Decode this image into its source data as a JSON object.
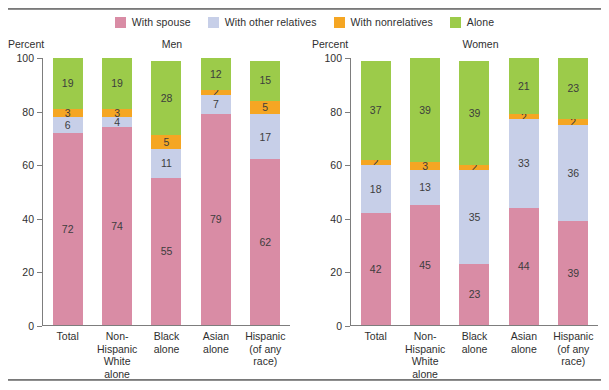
{
  "legend": {
    "items": [
      {
        "label": "With spouse",
        "key": "spouse",
        "color": "#d98ca5"
      },
      {
        "label": "With other relatives",
        "key": "relatives",
        "color": "#c7cfe8"
      },
      {
        "label": "With nonrelatives",
        "key": "nonrelatives",
        "color": "#f5a623"
      },
      {
        "label": "Alone",
        "key": "alone",
        "color": "#9ccb4a"
      }
    ]
  },
  "panels": [
    {
      "axis_name": "Percent",
      "title": "Men"
    },
    {
      "axis_name": "Percent",
      "title": "Women"
    }
  ],
  "chart_data": {
    "type": "bar",
    "title": "",
    "subtitle": "",
    "stacked": true,
    "xlabel": "",
    "ylabel": "Percent",
    "ylim": [
      0,
      100
    ],
    "yticks": [
      0,
      20,
      40,
      60,
      80,
      100
    ],
    "ytick_labels": [
      "0",
      "20",
      "40",
      "60",
      "80",
      "100"
    ],
    "grid": false,
    "legend_position": "top-center",
    "legend_entries": [
      "With spouse",
      "With other relatives",
      "With nonrelatives",
      "Alone"
    ],
    "categories": [
      "Total",
      "Non-Hispanic White alone",
      "Black alone",
      "Asian alone",
      "Hispanic (of any race)"
    ],
    "category_lines": [
      [
        "Total"
      ],
      [
        "Non-",
        "Hispanic",
        "White alone"
      ],
      [
        "Black",
        "alone"
      ],
      [
        "Asian",
        "alone"
      ],
      [
        "Hispanic",
        "(of any",
        "race)"
      ]
    ],
    "panels": [
      {
        "name": "Men",
        "series": [
          {
            "name": "With spouse",
            "color": "#d98ca5",
            "values": [
              72,
              74,
              55,
              79,
              62
            ]
          },
          {
            "name": "With other relatives",
            "color": "#c7cfe8",
            "values": [
              6,
              4,
              11,
              7,
              17
            ]
          },
          {
            "name": "With nonrelatives",
            "color": "#f5a623",
            "values": [
              3,
              3,
              5,
              2,
              5
            ]
          },
          {
            "name": "Alone",
            "color": "#9ccb4a",
            "values": [
              19,
              19,
              28,
              12,
              15
            ]
          }
        ]
      },
      {
        "name": "Women",
        "series": [
          {
            "name": "With spouse",
            "color": "#d98ca5",
            "values": [
              42,
              45,
              23,
              44,
              39
            ]
          },
          {
            "name": "With other relatives",
            "color": "#c7cfe8",
            "values": [
              18,
              13,
              35,
              33,
              36
            ]
          },
          {
            "name": "With nonrelatives",
            "color": "#f5a623",
            "values": [
              2,
              3,
              2,
              2,
              2
            ]
          },
          {
            "name": "Alone",
            "color": "#9ccb4a",
            "values": [
              37,
              39,
              39,
              21,
              23
            ]
          }
        ]
      }
    ]
  }
}
